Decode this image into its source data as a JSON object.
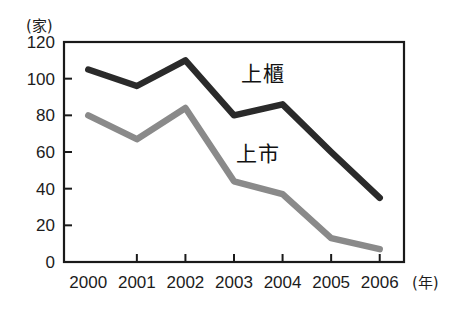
{
  "chart_data": {
    "type": "line",
    "title": "",
    "subtitle": "",
    "xlabel": "(年)",
    "ylabel": "(家)",
    "x": [
      2000,
      2001,
      2002,
      2003,
      2004,
      2005,
      2006
    ],
    "categories": [
      "2000",
      "2001",
      "2002",
      "2003",
      "2004",
      "2005",
      "2006"
    ],
    "series": [
      {
        "name": "上櫃",
        "color": "#2a2a2a",
        "values": [
          105,
          96,
          110,
          80,
          86,
          60,
          35
        ],
        "label_x": 2003.6,
        "label_y": 99
      },
      {
        "name": "上市",
        "color": "#8a8a8a",
        "values": [
          80,
          67,
          84,
          44,
          37,
          13,
          7
        ],
        "label_x": 2003.5,
        "label_y": 55
      }
    ],
    "yticks": [
      0,
      20,
      40,
      60,
      80,
      100,
      120
    ],
    "ytick_labels": [
      "0",
      "20",
      "40",
      "60",
      "80",
      "100",
      "120"
    ],
    "ylim": [
      0,
      120
    ],
    "xlim": [
      1999.5,
      2006.5
    ],
    "grid": false,
    "legend": "inline-annotations",
    "frame": "box"
  },
  "colors": {
    "background": "#ffffff",
    "axis": "#1a1a1a",
    "text": "#1c1c1c",
    "series_dark": "#2a2a2a",
    "series_gray": "#8a8a8a"
  }
}
